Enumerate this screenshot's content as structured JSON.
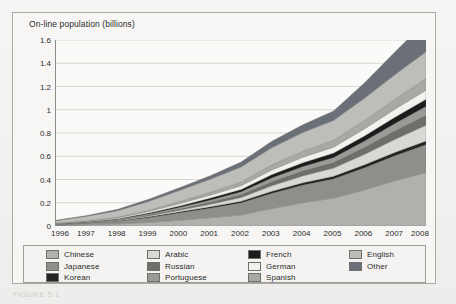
{
  "figure": {
    "caption": "FIGURE 5.1"
  },
  "chart_data": {
    "type": "area",
    "stacked": true,
    "title": "On-line population (billions)",
    "xlabel": "",
    "ylabel": "On-line population (billions)",
    "grid": true,
    "legend_position": "bottom",
    "x": [
      1996,
      1997,
      1998,
      1999,
      2000,
      2001,
      2002,
      2003,
      2004,
      2005,
      2006,
      2007,
      2008
    ],
    "xlim": [
      1996,
      2008
    ],
    "ylim": [
      0,
      1.6
    ],
    "yticks": [
      "0",
      "0.2",
      "0.4",
      "0.6",
      "0.8",
      "1",
      "1.2",
      "1.4",
      "1.6"
    ],
    "ytick_values": [
      0,
      0.2,
      0.4,
      0.6,
      0.8,
      1.0,
      1.2,
      1.4,
      1.6
    ],
    "xticks": [
      "1996",
      "1997",
      "1998",
      "1999",
      "2000",
      "2001",
      "2002",
      "2003",
      "2004",
      "2005",
      "2006",
      "2007",
      "2008"
    ],
    "totals": [
      0.05,
      0.09,
      0.14,
      0.22,
      0.32,
      0.42,
      0.53,
      0.7,
      0.82,
      0.93,
      1.14,
      1.35,
      1.58
    ],
    "series": [
      {
        "name": "Chinese",
        "color": "#b0b0ad",
        "values": [
          0.005,
          0.01,
          0.017,
          0.03,
          0.05,
          0.07,
          0.095,
          0.15,
          0.2,
          0.24,
          0.31,
          0.39,
          0.46
        ]
      },
      {
        "name": "Japanese",
        "color": "#8e8e8b",
        "values": [
          0.008,
          0.015,
          0.024,
          0.042,
          0.062,
          0.082,
          0.102,
          0.13,
          0.15,
          0.165,
          0.19,
          0.215,
          0.24
        ]
      },
      {
        "name": "Korean",
        "color": "#232323",
        "values": [
          0.001,
          0.002,
          0.004,
          0.007,
          0.01,
          0.013,
          0.016,
          0.019,
          0.021,
          0.023,
          0.026,
          0.029,
          0.032
        ]
      },
      {
        "name": "Arabic",
        "color": "#d8d8d5",
        "values": [
          0.001,
          0.002,
          0.004,
          0.008,
          0.014,
          0.022,
          0.032,
          0.048,
          0.06,
          0.07,
          0.09,
          0.112,
          0.135
        ]
      },
      {
        "name": "Russian",
        "color": "#6e6e6b",
        "values": [
          0.001,
          0.002,
          0.004,
          0.008,
          0.013,
          0.019,
          0.026,
          0.036,
          0.044,
          0.05,
          0.062,
          0.075,
          0.088
        ]
      },
      {
        "name": "Portuguese",
        "color": "#9a9a97",
        "values": [
          0.001,
          0.002,
          0.004,
          0.007,
          0.011,
          0.016,
          0.021,
          0.029,
          0.035,
          0.04,
          0.05,
          0.061,
          0.072
        ]
      },
      {
        "name": "French",
        "color": "#1c1c1c",
        "values": [
          0.002,
          0.003,
          0.005,
          0.009,
          0.013,
          0.018,
          0.023,
          0.03,
          0.035,
          0.039,
          0.047,
          0.055,
          0.063
        ]
      },
      {
        "name": "German",
        "color": "#f2f1ee",
        "values": [
          0.003,
          0.005,
          0.008,
          0.013,
          0.019,
          0.025,
          0.031,
          0.04,
          0.046,
          0.051,
          0.06,
          0.069,
          0.078
        ]
      },
      {
        "name": "Spanish",
        "color": "#a8a8a5",
        "values": [
          0.002,
          0.004,
          0.007,
          0.012,
          0.018,
          0.025,
          0.033,
          0.044,
          0.053,
          0.06,
          0.073,
          0.087,
          0.1
        ]
      },
      {
        "name": "English",
        "color": "#bdbdba",
        "values": [
          0.022,
          0.038,
          0.055,
          0.075,
          0.095,
          0.112,
          0.128,
          0.148,
          0.16,
          0.17,
          0.19,
          0.21,
          0.23
        ]
      },
      {
        "name": "Other",
        "color": "#6a6f78",
        "values": [
          0.004,
          0.007,
          0.012,
          0.019,
          0.025,
          0.03,
          0.043,
          0.056,
          0.066,
          0.082,
          0.132,
          0.197,
          0.262
        ]
      }
    ]
  },
  "legend": {
    "columns": [
      {
        "items": [
          "Chinese",
          "Japanese",
          "Korean"
        ]
      },
      {
        "items": [
          "Arabic",
          "Russian",
          "Portuguese"
        ]
      },
      {
        "items": [
          "French",
          "German",
          "Spanish"
        ]
      },
      {
        "items": [
          "English",
          "Other"
        ]
      }
    ]
  }
}
